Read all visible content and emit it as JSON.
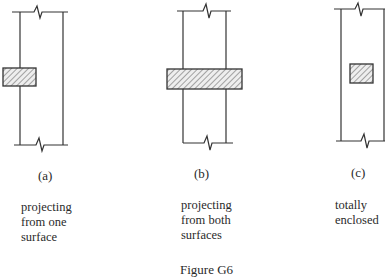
{
  "figure": {
    "caption": "Figure G6",
    "panels": [
      {
        "id": "a",
        "label": "(a)",
        "description": "projecting\nfrom one\nsurface"
      },
      {
        "id": "b",
        "label": "(b)",
        "description": "projecting\nfrom both\nsurfaces"
      },
      {
        "id": "c",
        "label": "(c)",
        "description": "totally\nenclosed"
      }
    ]
  },
  "colors": {
    "line": "#333333",
    "hatch": "#555555",
    "fill": "#e8e8e8"
  }
}
